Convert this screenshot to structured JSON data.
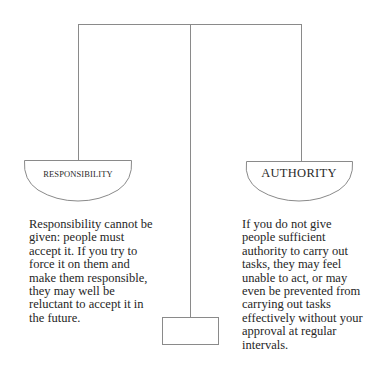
{
  "diagram": {
    "type": "balance-scale",
    "left_pan": {
      "label": "RESPONSIBILITY",
      "description_lines": [
        "Responsibility cannot be",
        "given: people must",
        "accept it. If you try to",
        "force it on them and",
        "make them responsible,",
        "they may well be",
        "reluctant to accept it in",
        "the future."
      ]
    },
    "right_pan": {
      "label": "AUTHORITY",
      "description_lines": [
        "If you do not give",
        "people sufficient",
        "authority to carry out",
        "tasks, they may feel",
        "unable to act, or may",
        "even be prevented from",
        "carrying out tasks",
        "effectively without your",
        "approval at regular",
        "intervals."
      ]
    },
    "colors": {
      "line": "#8a8a8a",
      "text": "#2a2a2a",
      "background": "#ffffff"
    }
  }
}
